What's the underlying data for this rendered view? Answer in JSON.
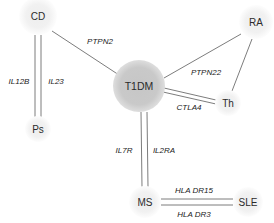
{
  "diagram": {
    "type": "network-graph",
    "background_color": "#ffffff",
    "node_fill_light": "#f2f2f2",
    "node_fill_dark": "#c9c9c9",
    "edge_color": "#5a5a5a",
    "text_color": "#2b2b2b",
    "nodes": [
      {
        "id": "cd",
        "label": "CD",
        "x": 38,
        "y": 16,
        "r": 19,
        "shade": "light"
      },
      {
        "id": "ra",
        "label": "RA",
        "x": 256,
        "y": 22,
        "r": 17,
        "shade": "light"
      },
      {
        "id": "t1dm",
        "label": "T1DM",
        "x": 139,
        "y": 86,
        "r": 26,
        "shade": "dark"
      },
      {
        "id": "th",
        "label": "Th",
        "x": 228,
        "y": 103,
        "r": 13,
        "shade": "light"
      },
      {
        "id": "ps",
        "label": "Ps",
        "x": 38,
        "y": 129,
        "r": 13,
        "shade": "light"
      },
      {
        "id": "ms",
        "label": "MS",
        "x": 145,
        "y": 202,
        "r": 16,
        "shade": "light"
      },
      {
        "id": "sle",
        "label": "SLE",
        "x": 248,
        "y": 202,
        "r": 15,
        "shade": "light"
      }
    ],
    "edges": [
      {
        "id": "cd-t1dm",
        "source": "CD",
        "target": "T1DM",
        "label": "PTPN2",
        "multiplicity": 1,
        "label_x": 100,
        "label_y": 41
      },
      {
        "id": "cd-ps-a",
        "source": "CD",
        "target": "Ps",
        "label": "IL12B",
        "multiplicity": 2,
        "label_x": 19,
        "label_y": 81
      },
      {
        "id": "cd-ps-b",
        "source": "CD",
        "target": "Ps",
        "label": "IL23",
        "multiplicity": 2,
        "label_x": 55,
        "label_y": 81
      },
      {
        "id": "t1dm-ra",
        "source": "T1DM",
        "target": "RA",
        "label": "PTPN22",
        "multiplicity": 1,
        "label_x": 206,
        "label_y": 72
      },
      {
        "id": "t1dm-th",
        "source": "T1DM",
        "target": "Th",
        "label": "CTLA4",
        "multiplicity": 2,
        "label_x": 189,
        "label_y": 106
      },
      {
        "id": "ra-th",
        "source": "RA",
        "target": "Th",
        "label": "",
        "multiplicity": 1,
        "label_x": 0,
        "label_y": 0
      },
      {
        "id": "t1dm-ms-a",
        "source": "T1DM",
        "target": "MS",
        "label": "IL7R",
        "multiplicity": 2,
        "label_x": 124,
        "label_y": 150
      },
      {
        "id": "t1dm-ms-b",
        "source": "T1DM",
        "target": "MS",
        "label": "IL2RA",
        "multiplicity": 2,
        "label_x": 163,
        "label_y": 150
      },
      {
        "id": "ms-sle-a",
        "source": "MS",
        "target": "SLE",
        "label": "HLA DR15",
        "multiplicity": 2,
        "label_x": 193,
        "label_y": 190
      },
      {
        "id": "ms-sle-b",
        "source": "MS",
        "target": "SLE",
        "label": "HLA DR3",
        "multiplicity": 2,
        "label_x": 193,
        "label_y": 212
      }
    ]
  }
}
